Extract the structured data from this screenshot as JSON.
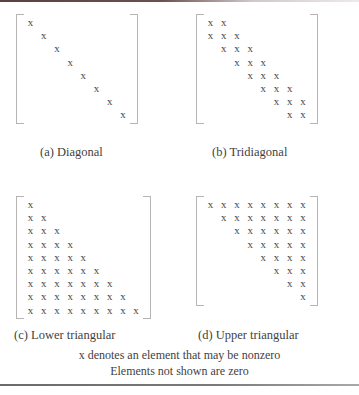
{
  "figure": {
    "element_symbol": "x",
    "rules": {
      "top": true,
      "bottom": true
    },
    "colors": {
      "text": "#3f3f3f",
      "symbol": "#4a4a4a",
      "bracket": "#b9b4b4",
      "background": "#ffffff",
      "rule": "#6b6b6b"
    }
  },
  "panels": [
    {
      "id": "a",
      "caption": "(a) Diagonal",
      "size": 8,
      "pattern": "diagonal",
      "rows": [
        [
          "x",
          "",
          "",
          "",
          "",
          "",
          "",
          ""
        ],
        [
          "",
          "x",
          "",
          "",
          "",
          "",
          "",
          ""
        ],
        [
          "",
          "",
          "x",
          "",
          "",
          "",
          "",
          ""
        ],
        [
          "",
          "",
          "",
          "x",
          "",
          "",
          "",
          ""
        ],
        [
          "",
          "",
          "",
          "",
          "x",
          "",
          "",
          ""
        ],
        [
          "",
          "",
          "",
          "",
          "",
          "x",
          "",
          ""
        ],
        [
          "",
          "",
          "",
          "",
          "",
          "",
          "x",
          ""
        ],
        [
          "",
          "",
          "",
          "",
          "",
          "",
          "",
          "x"
        ]
      ]
    },
    {
      "id": "b",
      "caption": "(b) Tridiagonal",
      "size": 8,
      "pattern": "tridiagonal",
      "rows": [
        [
          "x",
          "x",
          "",
          "",
          "",
          "",
          "",
          ""
        ],
        [
          "x",
          "x",
          "x",
          "",
          "",
          "",
          "",
          ""
        ],
        [
          "",
          "x",
          "x",
          "x",
          "",
          "",
          "",
          ""
        ],
        [
          "",
          "",
          "x",
          "x",
          "x",
          "",
          "",
          ""
        ],
        [
          "",
          "",
          "",
          "x",
          "x",
          "x",
          "",
          ""
        ],
        [
          "",
          "",
          "",
          "",
          "x",
          "x",
          "x",
          ""
        ],
        [
          "",
          "",
          "",
          "",
          "",
          "x",
          "x",
          "x"
        ],
        [
          "",
          "",
          "",
          "",
          "",
          "",
          "x",
          "x"
        ]
      ]
    },
    {
      "id": "c",
      "caption": "(c) Lower triangular",
      "size": 9,
      "pattern": "lower-triangular",
      "rows": [
        [
          "x",
          "",
          "",
          "",
          "",
          "",
          "",
          "",
          ""
        ],
        [
          "x",
          "x",
          "",
          "",
          "",
          "",
          "",
          "",
          ""
        ],
        [
          "x",
          "x",
          "x",
          "",
          "",
          "",
          "",
          "",
          ""
        ],
        [
          "x",
          "x",
          "x",
          "x",
          "",
          "",
          "",
          "",
          ""
        ],
        [
          "x",
          "x",
          "x",
          "x",
          "x",
          "",
          "",
          "",
          ""
        ],
        [
          "x",
          "x",
          "x",
          "x",
          "x",
          "x",
          "",
          "",
          ""
        ],
        [
          "x",
          "x",
          "x",
          "x",
          "x",
          "x",
          "x",
          "",
          ""
        ],
        [
          "x",
          "x",
          "x",
          "x",
          "x",
          "x",
          "x",
          "x",
          ""
        ],
        [
          "x",
          "x",
          "x",
          "x",
          "x",
          "x",
          "x",
          "x",
          "x"
        ]
      ]
    },
    {
      "id": "d",
      "caption": "(d) Upper triangular",
      "size": 8,
      "pattern": "upper-triangular",
      "rows": [
        [
          "x",
          "x",
          "x",
          "x",
          "x",
          "x",
          "x",
          "x"
        ],
        [
          "",
          "x",
          "x",
          "x",
          "x",
          "x",
          "x",
          "x"
        ],
        [
          "",
          "",
          "x",
          "x",
          "x",
          "x",
          "x",
          "x"
        ],
        [
          "",
          "",
          "",
          "x",
          "x",
          "x",
          "x",
          "x"
        ],
        [
          "",
          "",
          "",
          "",
          "x",
          "x",
          "x",
          "x"
        ],
        [
          "",
          "",
          "",
          "",
          "",
          "x",
          "x",
          "x"
        ],
        [
          "",
          "",
          "",
          "",
          "",
          "",
          "x",
          "x"
        ],
        [
          "",
          "",
          "",
          "",
          "",
          "",
          "",
          "x"
        ]
      ]
    }
  ],
  "notes": {
    "line1": "x denotes an element that may be nonzero",
    "line2": "Elements not shown are zero"
  }
}
